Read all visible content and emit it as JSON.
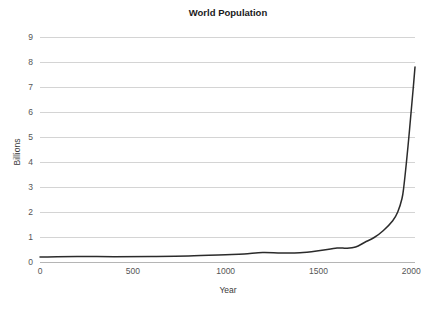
{
  "chart_data": {
    "type": "line",
    "title": "World Population",
    "xlabel": "Year",
    "ylabel": "Billions",
    "xlim": [
      0,
      2020
    ],
    "ylim": [
      0,
      9
    ],
    "xticks": [
      0,
      500,
      1000,
      1500,
      2000
    ],
    "xtick_labels": [
      "0",
      "500",
      "1000",
      "1500",
      "2000"
    ],
    "yticks": [
      0,
      1,
      2,
      3,
      4,
      5,
      6,
      7,
      8,
      9
    ],
    "ytick_labels": [
      "0",
      "1",
      "2",
      "3",
      "4",
      "5",
      "6",
      "7",
      "8",
      "9"
    ],
    "grid": true,
    "legend": null,
    "series": [
      {
        "name": "World Population",
        "x": [
          0,
          200,
          400,
          600,
          800,
          1000,
          1100,
          1200,
          1300,
          1400,
          1500,
          1600,
          1650,
          1700,
          1750,
          1800,
          1850,
          1900,
          1927,
          1950,
          1960,
          1974,
          1987,
          1999,
          2011,
          2020
        ],
        "values": [
          0.2,
          0.22,
          0.21,
          0.22,
          0.24,
          0.29,
          0.32,
          0.38,
          0.36,
          0.37,
          0.45,
          0.56,
          0.55,
          0.6,
          0.79,
          0.98,
          1.26,
          1.65,
          2.0,
          2.54,
          3.03,
          4.0,
          5.0,
          6.0,
          7.0,
          7.8
        ]
      }
    ],
    "colors": {
      "line": "#2b2b2b",
      "grid": "#c9c9c9",
      "axis": "#b5b5b5",
      "text": "#555555",
      "title": "#1a1a1a",
      "background": "#ffffff"
    }
  }
}
